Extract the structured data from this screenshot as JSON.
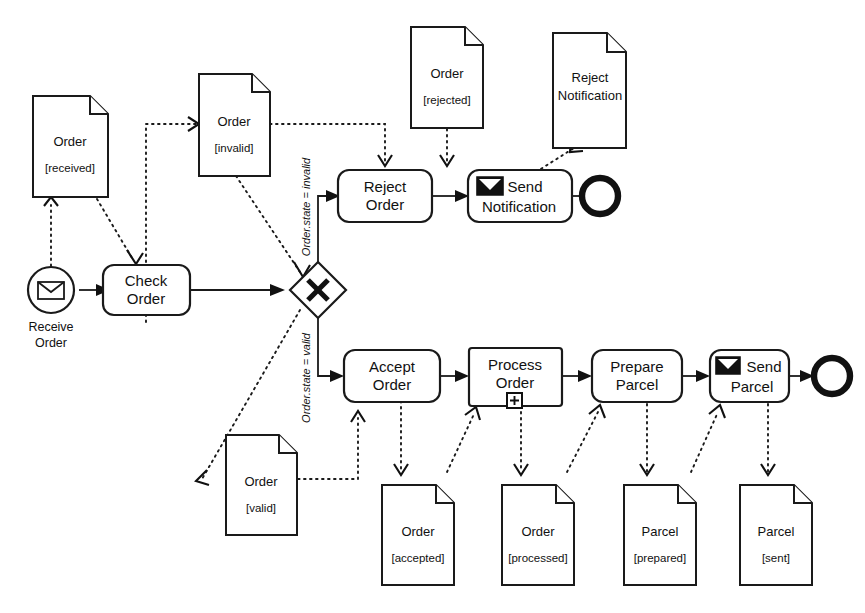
{
  "diagram": {
    "notation": "BPMN 2.0",
    "stroke_color": "#1a1a1a",
    "fill_color": "#ffffff"
  },
  "events": [
    {
      "id": "receive-order",
      "kind": "message-start-event",
      "label_line1": "Receive",
      "label_line2": "Order",
      "icon": "envelope-icon"
    },
    {
      "id": "end-reject",
      "kind": "end-event",
      "label": ""
    },
    {
      "id": "end-send-parcel",
      "kind": "end-event",
      "label": ""
    }
  ],
  "tasks": [
    {
      "id": "check-order",
      "line1": "Check",
      "line2": "Order",
      "marker": "none",
      "icon": "none"
    },
    {
      "id": "reject-order",
      "line1": "Reject",
      "line2": "Order",
      "marker": "none",
      "icon": "none"
    },
    {
      "id": "send-notification",
      "line1": "Send",
      "line2": "Notification",
      "marker": "none",
      "icon": "envelope-icon"
    },
    {
      "id": "accept-order",
      "line1": "Accept",
      "line2": "Order",
      "marker": "none",
      "icon": "none"
    },
    {
      "id": "process-order",
      "line1": "Process",
      "line2": "Order",
      "marker": "collapsed-subprocess-plus",
      "icon": "none"
    },
    {
      "id": "prepare-parcel",
      "line1": "Prepare",
      "line2": "Parcel",
      "marker": "none",
      "icon": "none"
    },
    {
      "id": "send-parcel",
      "line1": "Send",
      "line2": "Parcel",
      "marker": "none",
      "icon": "envelope-icon"
    }
  ],
  "gateway": {
    "id": "order-state-gateway",
    "kind": "exclusive-gateway",
    "marker": "x-marker"
  },
  "conditions": [
    {
      "id": "cond-invalid",
      "text": "Order.state = invalid"
    },
    {
      "id": "cond-valid",
      "text": "Order.state = valid"
    }
  ],
  "data_objects": [
    {
      "id": "order-received",
      "name": "Order",
      "state": "[received]"
    },
    {
      "id": "order-invalid",
      "name": "Order",
      "state": "[invalid]"
    },
    {
      "id": "order-rejected",
      "name": "Order",
      "state": "[rejected]"
    },
    {
      "id": "reject-notification",
      "name_line1": "Reject",
      "name_line2": "Notification",
      "state": ""
    },
    {
      "id": "order-valid",
      "name": "Order",
      "state": "[valid]"
    },
    {
      "id": "order-accepted",
      "name": "Order",
      "state": "[accepted]"
    },
    {
      "id": "order-processed",
      "name": "Order",
      "state": "[processed]"
    },
    {
      "id": "parcel-prepared",
      "name": "Parcel",
      "state": "[prepared]"
    },
    {
      "id": "parcel-sent",
      "name": "Parcel",
      "state": "[sent]"
    }
  ]
}
